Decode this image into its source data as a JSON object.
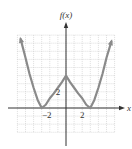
{
  "chart_data": {
    "type": "line",
    "title": "",
    "xlabel": "x",
    "ylabel": "f(x)",
    "xlim": [
      -6,
      6
    ],
    "ylim": [
      -3,
      9
    ],
    "grid": true,
    "x_ticks_labeled": [
      {
        "value": -2,
        "label": "−2"
      },
      {
        "value": 2,
        "label": "2"
      }
    ],
    "y_ticks_labeled": [
      {
        "value": 2,
        "label": "2"
      }
    ],
    "series": [
      {
        "name": "f(x)",
        "color": "#8a8a8a",
        "arrows_at_ends": true,
        "points": [
          [
            -5.6,
            8.5
          ],
          [
            -5,
            6.2
          ],
          [
            -4.5,
            4.2
          ],
          [
            -4,
            2.5
          ],
          [
            -3.5,
            1.0
          ],
          [
            -3,
            0
          ],
          [
            -2.5,
            0.4
          ],
          [
            -2,
            1.2
          ],
          [
            -1.5,
            1.8
          ],
          [
            -1,
            2.5
          ],
          [
            -0.5,
            3.2
          ],
          [
            0,
            4
          ],
          [
            0.5,
            3.2
          ],
          [
            1,
            2.5
          ],
          [
            1.5,
            1.8
          ],
          [
            2,
            1.2
          ],
          [
            2.5,
            0.4
          ],
          [
            3,
            0
          ],
          [
            3.5,
            1.0
          ],
          [
            4,
            2.5
          ],
          [
            4.5,
            4.2
          ],
          [
            5,
            6.2
          ],
          [
            5.6,
            8.2
          ]
        ]
      }
    ]
  },
  "header_fragment": "f(x) = [...]"
}
